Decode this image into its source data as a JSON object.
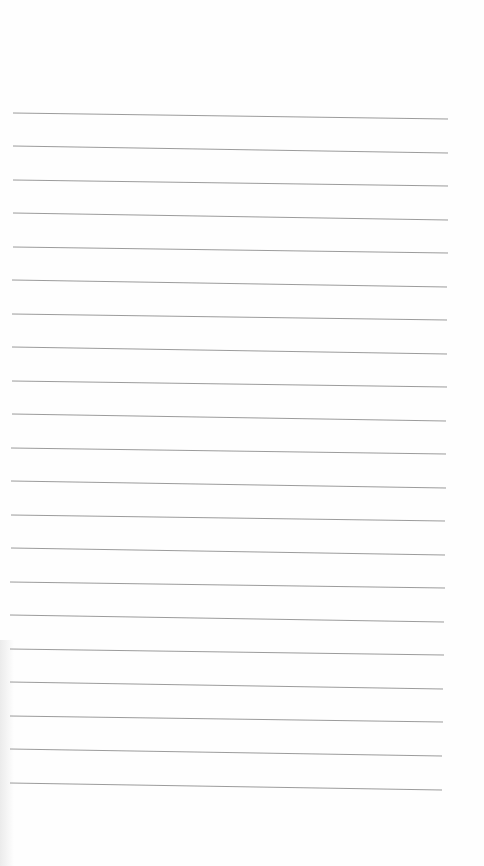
{
  "page": {
    "type": "blank lined paper",
    "background_color": "#fefefe",
    "rule_color": "#8a8a8a",
    "rule_count": 21,
    "rules": [
      {
        "x1": 13,
        "y1": 113,
        "x2": 448,
        "y2": 119
      },
      {
        "x1": 13,
        "y1": 146,
        "x2": 448,
        "y2": 153
      },
      {
        "x1": 13,
        "y1": 180,
        "x2": 448,
        "y2": 186
      },
      {
        "x1": 13,
        "y1": 213,
        "x2": 448,
        "y2": 220
      },
      {
        "x1": 13,
        "y1": 247,
        "x2": 448,
        "y2": 253
      },
      {
        "x1": 12,
        "y1": 280,
        "x2": 447,
        "y2": 287
      },
      {
        "x1": 12,
        "y1": 314,
        "x2": 447,
        "y2": 320
      },
      {
        "x1": 12,
        "y1": 347,
        "x2": 447,
        "y2": 354
      },
      {
        "x1": 12,
        "y1": 381,
        "x2": 447,
        "y2": 387
      },
      {
        "x1": 12,
        "y1": 414,
        "x2": 446,
        "y2": 421
      },
      {
        "x1": 11,
        "y1": 448,
        "x2": 446,
        "y2": 454
      },
      {
        "x1": 11,
        "y1": 481,
        "x2": 446,
        "y2": 488
      },
      {
        "x1": 11,
        "y1": 515,
        "x2": 445,
        "y2": 521
      },
      {
        "x1": 11,
        "y1": 548,
        "x2": 445,
        "y2": 555
      },
      {
        "x1": 10,
        "y1": 582,
        "x2": 445,
        "y2": 588
      },
      {
        "x1": 10,
        "y1": 615,
        "x2": 444,
        "y2": 622
      },
      {
        "x1": 10,
        "y1": 649,
        "x2": 444,
        "y2": 655
      },
      {
        "x1": 10,
        "y1": 682,
        "x2": 443,
        "y2": 689
      },
      {
        "x1": 10,
        "y1": 716,
        "x2": 443,
        "y2": 722
      },
      {
        "x1": 10,
        "y1": 749,
        "x2": 442,
        "y2": 756
      },
      {
        "x1": 10,
        "y1": 783,
        "x2": 442,
        "y2": 790
      }
    ]
  }
}
